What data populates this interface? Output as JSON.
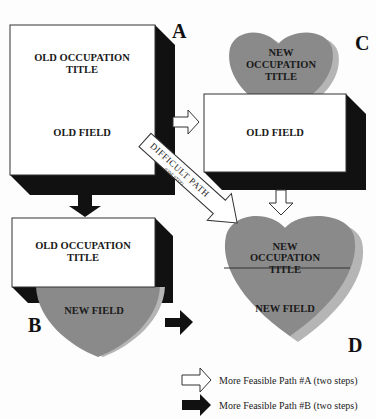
{
  "colors": {
    "heart_fill": "#8a8a8a",
    "heart_shadow": "#b5b5b5",
    "box_fill": "#ffffff",
    "box_shadow": "#111111",
    "background": "#fdfdfd"
  },
  "boxes": {
    "A": {
      "letter": "A",
      "title_line1": "OLD OCCUPATION",
      "title_line2": "TITLE",
      "field": "OLD FIELD"
    },
    "B": {
      "letter": "B",
      "title_line1": "OLD OCCUPATION",
      "title_line2": "TITLE",
      "field": "NEW FIELD"
    },
    "C": {
      "letter": "C",
      "title_line1": "NEW",
      "title_line2": "OCCUPATION",
      "title_line3": "TITLE",
      "field": "OLD FIELD"
    },
    "D": {
      "letter": "D",
      "title_line1": "NEW",
      "title_line2": "OCCUPATION",
      "title_line3": "TITLE",
      "field": "NEW FIELD"
    }
  },
  "difficult_path": {
    "label": "DIFFICULT PATH",
    "sublabel": "(ONE STEP)"
  },
  "legend": [
    {
      "icon": "white-arrow-icon",
      "label": "More Feasible Path #A (two steps)"
    },
    {
      "icon": "black-arrow-icon",
      "label": "More Feasible Path #B (two steps)"
    }
  ]
}
